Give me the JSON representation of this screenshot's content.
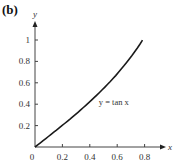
{
  "panel_label": "(b)",
  "chart_data": {
    "type": "line",
    "title": "",
    "xlabel": "x",
    "ylabel": "y",
    "xlim": [
      0,
      0.9
    ],
    "ylim": [
      0,
      1.1
    ],
    "grid": false,
    "x_ticks": [
      "0.2",
      "0.4",
      "0.6",
      "0.8"
    ],
    "y_ticks": [
      "0.2",
      "0.4",
      "0.6",
      "0.8",
      "1"
    ],
    "origin_label": "0",
    "series": [
      {
        "name": "y = tan x",
        "function": "tan(x)",
        "x": [
          0,
          0.1,
          0.2,
          0.3,
          0.4,
          0.5,
          0.6,
          0.7,
          0.785
        ],
        "y": [
          0,
          0.1003,
          0.2027,
          0.3093,
          0.4228,
          0.5463,
          0.6841,
          0.8423,
          1.0
        ]
      }
    ],
    "annotations": [
      {
        "text": "y = tan x",
        "x": 0.48,
        "y": 0.42
      }
    ]
  }
}
